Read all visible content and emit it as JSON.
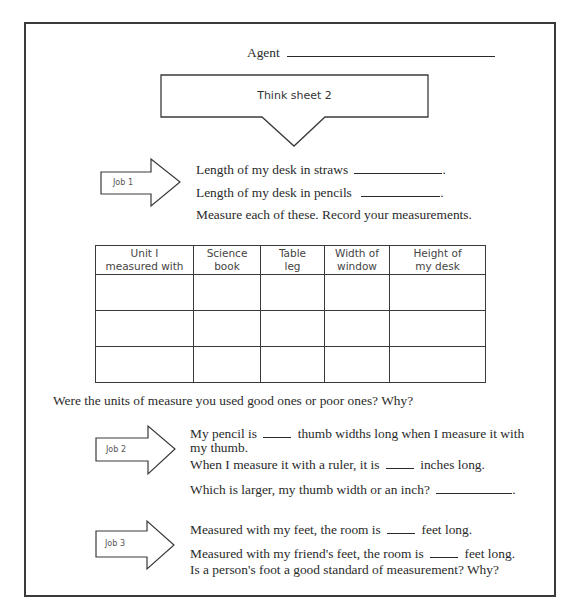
{
  "header": {
    "agent_label": "Agent"
  },
  "callout": {
    "title": "Think sheet 2"
  },
  "job1": {
    "label": "Job 1",
    "line1": "Length of my desk in straws",
    "line2": "Length of my desk in pencils",
    "instruction": "Measure each of these. Record your measurements."
  },
  "table": {
    "headers": [
      {
        "line1": "Unit I",
        "line2": "measured with"
      },
      {
        "line1": "Science",
        "line2": "book"
      },
      {
        "line1": "Table",
        "line2": "leg"
      },
      {
        "line1": "Width of",
        "line2": "window"
      },
      {
        "line1": "Height of",
        "line2": "my desk"
      }
    ],
    "rows": [
      [
        "",
        "",
        "",
        "",
        ""
      ],
      [
        "",
        "",
        "",
        "",
        ""
      ],
      [
        "",
        "",
        "",
        "",
        ""
      ]
    ]
  },
  "question1": "Were the units of measure you used good ones or poor ones? Why?",
  "job2": {
    "label": "Job 2",
    "line1a": "My pencil is",
    "line1b": "thumb widths long when I measure it with",
    "line1c": "my thumb.",
    "line2a": "When I measure it with a ruler, it is",
    "line2b": "inches long.",
    "line3": "Which is larger, my thumb width or an inch?"
  },
  "job3": {
    "label": "Job 3",
    "line1a": "Measured with my feet, the room is",
    "line1b": "feet long.",
    "line2a": "Measured with my friend's feet, the room is",
    "line2b": "feet long.",
    "line3": "Is a person's foot a good standard of measurement? Why?"
  }
}
